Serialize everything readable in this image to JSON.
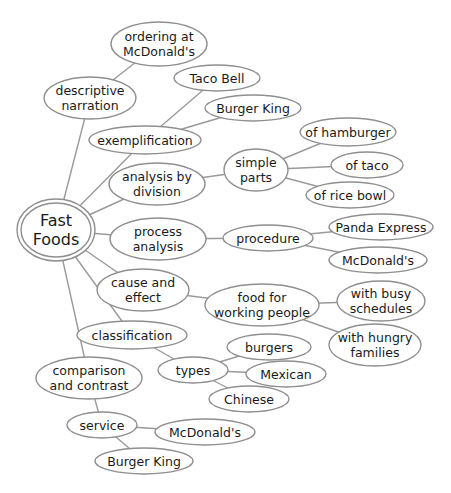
{
  "colors": {
    "stroke": "#8f8f8f",
    "edge": "#9a9a9a",
    "text": "#1a1a1a",
    "fill": "#ffffff"
  },
  "nodes": [
    {
      "id": "root",
      "lines": [
        "Fast",
        "Foods"
      ],
      "cx": 56,
      "cy": 230,
      "rx": 35,
      "ry": 27,
      "root": true
    },
    {
      "id": "descriptive",
      "lines": [
        "descriptive",
        "narration"
      ],
      "cx": 90,
      "cy": 98,
      "rx": 46,
      "ry": 21
    },
    {
      "id": "ordering",
      "lines": [
        "ordering at",
        "McDonald's"
      ],
      "cx": 159,
      "cy": 44,
      "rx": 48,
      "ry": 22
    },
    {
      "id": "exemplification",
      "lines": [
        "exemplification"
      ],
      "cx": 145,
      "cy": 140,
      "rx": 56,
      "ry": 14
    },
    {
      "id": "tacobell1",
      "lines": [
        "Taco Bell"
      ],
      "cx": 217,
      "cy": 78,
      "rx": 43,
      "ry": 13
    },
    {
      "id": "burgerking1",
      "lines": [
        "Burger King"
      ],
      "cx": 253,
      "cy": 108,
      "rx": 48,
      "ry": 13
    },
    {
      "id": "division",
      "lines": [
        "analysis by",
        "division"
      ],
      "cx": 157,
      "cy": 184,
      "rx": 48,
      "ry": 21
    },
    {
      "id": "simpleparts",
      "lines": [
        "simple",
        "parts"
      ],
      "cx": 256,
      "cy": 170,
      "rx": 32,
      "ry": 21
    },
    {
      "id": "hamburger",
      "lines": [
        "of hamburger"
      ],
      "cx": 348,
      "cy": 132,
      "rx": 48,
      "ry": 14
    },
    {
      "id": "taco",
      "lines": [
        "of taco"
      ],
      "cx": 367,
      "cy": 165,
      "rx": 36,
      "ry": 13
    },
    {
      "id": "ricebowl",
      "lines": [
        "of rice bowl"
      ],
      "cx": 350,
      "cy": 195,
      "rx": 44,
      "ry": 13
    },
    {
      "id": "process",
      "lines": [
        "process",
        "analysis"
      ],
      "cx": 158,
      "cy": 239,
      "rx": 48,
      "ry": 21
    },
    {
      "id": "procedure",
      "lines": [
        "procedure"
      ],
      "cx": 268,
      "cy": 238,
      "rx": 45,
      "ry": 13
    },
    {
      "id": "panda",
      "lines": [
        "Panda Express"
      ],
      "cx": 381,
      "cy": 227,
      "rx": 52,
      "ry": 13
    },
    {
      "id": "mcd1",
      "lines": [
        "McDonald's"
      ],
      "cx": 378,
      "cy": 260,
      "rx": 49,
      "ry": 13
    },
    {
      "id": "cause",
      "lines": [
        "cause and",
        "effect"
      ],
      "cx": 143,
      "cy": 290,
      "rx": 46,
      "ry": 21
    },
    {
      "id": "foodfor",
      "lines": [
        "food for",
        "working people"
      ],
      "cx": 262,
      "cy": 305,
      "rx": 57,
      "ry": 21
    },
    {
      "id": "busy",
      "lines": [
        "with busy",
        "schedules"
      ],
      "cx": 381,
      "cy": 301,
      "rx": 44,
      "ry": 20
    },
    {
      "id": "hungry",
      "lines": [
        "with hungry",
        "families"
      ],
      "cx": 375,
      "cy": 345,
      "rx": 46,
      "ry": 21
    },
    {
      "id": "classification",
      "lines": [
        "classification"
      ],
      "cx": 132,
      "cy": 335,
      "rx": 55,
      "ry": 14
    },
    {
      "id": "types",
      "lines": [
        "types"
      ],
      "cx": 193,
      "cy": 370,
      "rx": 35,
      "ry": 13
    },
    {
      "id": "burgers",
      "lines": [
        "burgers"
      ],
      "cx": 269,
      "cy": 347,
      "rx": 42,
      "ry": 13
    },
    {
      "id": "mexican",
      "lines": [
        "Mexican"
      ],
      "cx": 286,
      "cy": 374,
      "rx": 40,
      "ry": 13
    },
    {
      "id": "chinese",
      "lines": [
        "Chinese"
      ],
      "cx": 249,
      "cy": 399,
      "rx": 40,
      "ry": 13
    },
    {
      "id": "comparison",
      "lines": [
        "comparison",
        "and contrast"
      ],
      "cx": 89,
      "cy": 378,
      "rx": 53,
      "ry": 21
    },
    {
      "id": "service",
      "lines": [
        "service"
      ],
      "cx": 102,
      "cy": 425,
      "rx": 35,
      "ry": 13
    },
    {
      "id": "mcd2",
      "lines": [
        "McDonald's"
      ],
      "cx": 205,
      "cy": 432,
      "rx": 50,
      "ry": 13
    },
    {
      "id": "burgerking2",
      "lines": [
        "Burger King"
      ],
      "cx": 144,
      "cy": 461,
      "rx": 49,
      "ry": 13
    }
  ],
  "edges": [
    [
      "root",
      "descriptive"
    ],
    [
      "descriptive",
      "ordering"
    ],
    [
      "root",
      "exemplification"
    ],
    [
      "exemplification",
      "tacobell1"
    ],
    [
      "exemplification",
      "burgerking1"
    ],
    [
      "root",
      "division"
    ],
    [
      "division",
      "simpleparts"
    ],
    [
      "simpleparts",
      "hamburger"
    ],
    [
      "simpleparts",
      "taco"
    ],
    [
      "simpleparts",
      "ricebowl"
    ],
    [
      "root",
      "process"
    ],
    [
      "process",
      "procedure"
    ],
    [
      "procedure",
      "panda"
    ],
    [
      "procedure",
      "mcd1"
    ],
    [
      "root",
      "cause"
    ],
    [
      "cause",
      "foodfor"
    ],
    [
      "foodfor",
      "busy"
    ],
    [
      "foodfor",
      "hungry"
    ],
    [
      "root",
      "classification"
    ],
    [
      "classification",
      "types"
    ],
    [
      "types",
      "burgers"
    ],
    [
      "types",
      "mexican"
    ],
    [
      "types",
      "chinese"
    ],
    [
      "root",
      "comparison"
    ],
    [
      "comparison",
      "service"
    ],
    [
      "service",
      "mcd2"
    ],
    [
      "service",
      "burgerking2"
    ]
  ]
}
